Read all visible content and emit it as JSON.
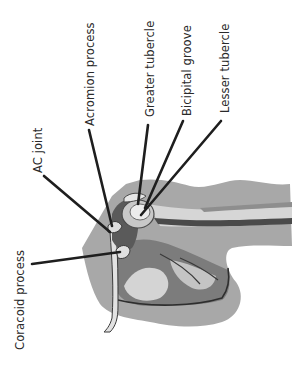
{
  "diagram": {
    "labels": [
      {
        "id": "coracoid-process",
        "text": "Coracoid process"
      },
      {
        "id": "ac-joint",
        "text": "AC joint"
      },
      {
        "id": "acromion-process",
        "text": "Acromion process"
      },
      {
        "id": "greater-tubercle",
        "text": "Greater tubercle"
      },
      {
        "id": "bicipital-groove",
        "text": "Bicipital groove"
      },
      {
        "id": "lesser-tubercle",
        "text": "Lesser tubercle"
      }
    ]
  },
  "colors": {
    "background": "#ffffff",
    "body_silhouette": "#a6a6a6",
    "bone_light": "#d9d9d9",
    "bone_mid": "#8c8c8c",
    "bone_dark": "#4a4a4a",
    "leader_line": "#1e1e1e",
    "label_text": "#2a2a2a"
  }
}
